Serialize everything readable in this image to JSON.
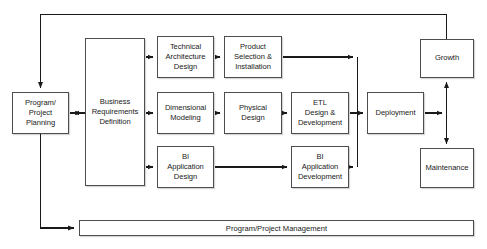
{
  "diagram": {
    "style": {
      "box_border_color": "#4d4d4d",
      "box_fill_color": "#ffffff",
      "line_color": "#1a1a1a",
      "text_color": "#1a1a1a",
      "background_color": "#ffffff"
    },
    "nodes": [
      {
        "id": "program_project_planning",
        "label": "Program/\nProject\nPlanning",
        "line1": "Program/",
        "line2": "Project",
        "line3": "Planning",
        "x": 12,
        "y": 92,
        "w": 57,
        "h": 42
      },
      {
        "id": "business_requirements_definition",
        "label": "Business\nRequirements\nDefinition",
        "line1": "Business",
        "line2": "Requirements",
        "line3": "Definition",
        "x": 85,
        "y": 38,
        "w": 60,
        "h": 148
      },
      {
        "id": "technical_architecture_design",
        "label": "Technical\nArchitecture\nDesign",
        "line1": "Technical",
        "line2": "Architecture",
        "line3": "Design",
        "x": 157,
        "y": 36,
        "w": 57,
        "h": 42
      },
      {
        "id": "product_selection_installation",
        "label": "Product\nSelection &\nInstallation",
        "line1": "Product",
        "line2": "Selection &",
        "line3": "Installation",
        "x": 224,
        "y": 36,
        "w": 58,
        "h": 42
      },
      {
        "id": "dimensional_modeling",
        "label": "Dimensional\nModeling",
        "line1": "Dimensional",
        "line2": "Modeling",
        "line3": "",
        "x": 157,
        "y": 92,
        "w": 57,
        "h": 42
      },
      {
        "id": "physical_design",
        "label": "Physical\nDesign",
        "line1": "Physical",
        "line2": "Design",
        "line3": "",
        "x": 224,
        "y": 92,
        "w": 58,
        "h": 42
      },
      {
        "id": "etl_design_development",
        "label": "ETL\nDesign &\nDevelopment",
        "line1": "ETL",
        "line2": "Design &",
        "line3": "Development",
        "x": 291,
        "y": 92,
        "w": 58,
        "h": 42
      },
      {
        "id": "bi_application_design",
        "label": "BI\nApplication\nDesign",
        "line1": "BI",
        "line2": "Application",
        "line3": "Design",
        "x": 157,
        "y": 146,
        "w": 57,
        "h": 42
      },
      {
        "id": "bi_application_development",
        "label": "BI\nApplication\nDevelopment",
        "line1": "BI",
        "line2": "Application",
        "line3": "Development",
        "x": 291,
        "y": 146,
        "w": 58,
        "h": 42
      },
      {
        "id": "deployment",
        "label": "Deployment",
        "line1": "Deployment",
        "line2": "",
        "line3": "",
        "x": 367,
        "y": 92,
        "w": 57,
        "h": 42
      },
      {
        "id": "growth",
        "label": "Growth",
        "line1": "Growth",
        "line2": "",
        "line3": "",
        "x": 420,
        "y": 39,
        "w": 54,
        "h": 39
      },
      {
        "id": "maintenance",
        "label": "Maintenance",
        "line1": "Maintenance",
        "line2": "",
        "line3": "",
        "x": 420,
        "y": 148,
        "w": 54,
        "h": 40
      }
    ],
    "bottom_bar": {
      "id": "program_project_management",
      "label": "Program/Project Management",
      "x": 79,
      "y": 220,
      "w": 395,
      "h": 16
    },
    "edges": [
      {
        "from": "growth",
        "to": "program_project_planning",
        "kind": "feedback-top"
      },
      {
        "from": "program_project_planning",
        "to": "business_requirements_definition",
        "kind": "bidirectional"
      },
      {
        "from": "business_requirements_definition",
        "to": "technical_architecture_design",
        "kind": "arrow"
      },
      {
        "from": "technical_architecture_design",
        "to": "product_selection_installation",
        "kind": "arrow"
      },
      {
        "from": "product_selection_installation",
        "to": "deployment_bus",
        "kind": "arrow"
      },
      {
        "from": "business_requirements_definition",
        "to": "dimensional_modeling",
        "kind": "arrow"
      },
      {
        "from": "dimensional_modeling",
        "to": "physical_design",
        "kind": "arrow"
      },
      {
        "from": "physical_design",
        "to": "etl_design_development",
        "kind": "arrow"
      },
      {
        "from": "etl_design_development",
        "to": "deployment",
        "kind": "arrow"
      },
      {
        "from": "business_requirements_definition",
        "to": "bi_application_design",
        "kind": "arrow"
      },
      {
        "from": "bi_application_design",
        "to": "bi_application_development",
        "kind": "arrow"
      },
      {
        "from": "bi_application_development",
        "to": "deployment_bus",
        "kind": "arrow"
      },
      {
        "from": "deployment",
        "to": "growth_maintenance_bus",
        "kind": "arrow"
      },
      {
        "from": "growth",
        "to": "maintenance",
        "kind": "bidirectional-vertical"
      },
      {
        "from": "program_project_planning",
        "to": "program_project_management",
        "kind": "arrow-down-right"
      }
    ]
  }
}
